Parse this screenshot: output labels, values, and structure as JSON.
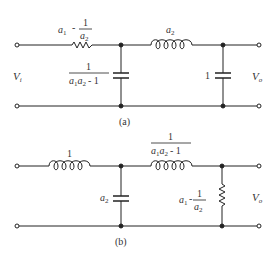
{
  "diagram_a": {
    "caption": "(a)",
    "input_label": "V",
    "input_sub": "i",
    "output_label": "V",
    "output_sub": "o",
    "series_resistor": {
      "num_a": "a",
      "num_a_sub": "1",
      "minus": "-",
      "frac_num": "1",
      "frac_den": "a",
      "frac_den_sub": "2"
    },
    "series_inductor": {
      "label": "a",
      "label_sub": "2"
    },
    "shunt_capacitor_1": {
      "num": "1",
      "den_a1": "a",
      "den_a1_sub": "1",
      "den_a2": "a",
      "den_a2_sub": "2",
      "den_minus": "- 1"
    },
    "shunt_capacitor_2": {
      "label": "1"
    }
  },
  "diagram_b": {
    "caption": "(b)",
    "output_label": "V",
    "output_sub": "o",
    "series_inductor_1": {
      "label": "1"
    },
    "shunt_capacitor": {
      "label": "a",
      "label_sub": "2"
    },
    "series_inductor_2": {
      "num": "1",
      "den_a1": "a",
      "den_a1_sub": "1",
      "den_a2": "a",
      "den_a2_sub": "2",
      "den_minus": "- 1"
    },
    "shunt_resistor": {
      "num_a": "a",
      "num_a_sub": "1",
      "minus": "-",
      "frac_num": "1",
      "frac_den": "a",
      "frac_den_sub": "2"
    }
  },
  "colors": {
    "wire": "#222222",
    "text": "#333333"
  }
}
